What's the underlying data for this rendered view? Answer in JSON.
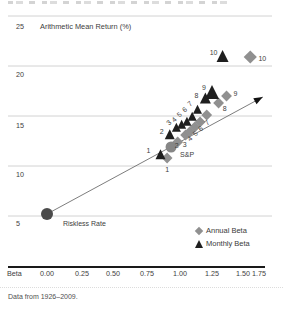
{
  "figure": {
    "title": "Arithmetic Mean Return (%)",
    "footnote": "Data from 1926–2009.",
    "x_axis_label": "Beta",
    "x_ticks": [
      "0.00",
      "0.25",
      "0.50",
      "0.75",
      "1.00",
      "1.25",
      "1.50",
      "1.75"
    ],
    "y_ticks": [
      "25",
      "20",
      "15",
      "10",
      "5"
    ]
  },
  "legend": {
    "annual_label": "Annual Beta",
    "monthly_label": "Monthly Beta"
  },
  "colors": {
    "monthly_triangle": "#1f1f1f",
    "annual_diamond": "#909090",
    "sp500_circle": "#868686",
    "riskless_circle": "#4b4b4b",
    "grid_line": "#d2d2d2",
    "sml_line": "#6e6e6e",
    "axis_bar": "#1a1a1a",
    "label_text": "#3d3d3d"
  },
  "chart_data": {
    "type": "scatter",
    "title": "Arithmetic Mean Return (%)",
    "xlabel": "Beta",
    "ylabel": "Arithmetic Mean Return (%)",
    "xlim": [
      -0.3,
      1.78
    ],
    "ylim": [
      2.5,
      25
    ],
    "x_tick_values": [
      0,
      0.25,
      0.5,
      0.75,
      1.0,
      1.25,
      1.5,
      1.75
    ],
    "y_tick_values": [
      25,
      20,
      15,
      10,
      5
    ],
    "grid": "horizontal",
    "legend_position": "bottom-right",
    "footnote": "Data from 1926–2009.",
    "series": [
      {
        "name": "Annual Beta",
        "marker": "diamond",
        "points": [
          {
            "label": "1",
            "beta": 0.91,
            "ret": 10.8,
            "lx": 0,
            "ly": 11
          },
          {
            "label": "2",
            "beta": 0.99,
            "ret": 12.4,
            "lx": -1,
            "ly": 3
          },
          {
            "label": "3",
            "beta": 1.05,
            "ret": 13.1,
            "lx": -1,
            "ly": 9
          },
          {
            "label": "4",
            "beta": 1.08,
            "ret": 13.4,
            "lx": 2,
            "ly": 6,
            "rot": -42
          },
          {
            "label": "5",
            "beta": 1.12,
            "ret": 13.9,
            "lx": 2,
            "ly": 6,
            "rot": -42
          },
          {
            "label": "6",
            "beta": 1.16,
            "ret": 14.4,
            "lx": 2,
            "ly": 6,
            "rot": -42
          },
          {
            "label": "7",
            "beta": 1.21,
            "ret": 15.1,
            "lx": 2,
            "ly": 7,
            "rot": -42
          },
          {
            "label": "8",
            "beta": 1.3,
            "ret": 16.3,
            "lx": 6,
            "ly": 5
          },
          {
            "label": "9",
            "beta": 1.36,
            "ret": 17.0,
            "lx": 9,
            "ly": -3
          },
          {
            "label": "10",
            "beta": 1.54,
            "ret": 20.9,
            "lx": 12,
            "ly": 1,
            "s": 11
          }
        ]
      },
      {
        "name": "Monthly Beta",
        "marker": "triangle",
        "points": [
          {
            "label": "1",
            "beta": 0.86,
            "ret": 11.1,
            "lx": -12,
            "ly": -5
          },
          {
            "label": "2",
            "beta": 0.93,
            "ret": 13.1,
            "lx": -8,
            "ly": -4
          },
          {
            "label": "3",
            "beta": 0.98,
            "ret": 13.8,
            "lx": -6,
            "ly": -6,
            "rot": -42,
            "s": 9
          },
          {
            "label": "4",
            "beta": 1.02,
            "ret": 14.1,
            "lx": -6,
            "ly": -6,
            "rot": -42,
            "s": 9
          },
          {
            "label": "5",
            "beta": 1.06,
            "ret": 14.4,
            "lx": -6,
            "ly": -8,
            "rot": -42,
            "s": 9
          },
          {
            "label": "6",
            "beta": 1.1,
            "ret": 14.9,
            "lx": -6,
            "ly": -8,
            "rot": -42,
            "s": 9
          },
          {
            "label": "7",
            "beta": 1.14,
            "ret": 15.6,
            "lx": -6,
            "ly": -7,
            "rot": -42,
            "s": 9
          },
          {
            "label": "8",
            "beta": 1.2,
            "ret": 16.7,
            "lx": -9,
            "ly": -4,
            "s": 11
          },
          {
            "label": "9",
            "beta": 1.25,
            "ret": 17.3,
            "lx": -8,
            "ly": -6,
            "s": 14
          },
          {
            "label": "10",
            "beta": 1.33,
            "ret": 20.9,
            "lx": -9,
            "ly": -5,
            "s": 12
          }
        ]
      },
      {
        "name": "S&P",
        "marker": "circle",
        "points": [
          {
            "label": "S&P",
            "beta": 0.94,
            "ret": 11.9,
            "r": 5.5,
            "lx": 9,
            "ly": 7,
            "anchor": "start"
          }
        ]
      },
      {
        "name": "Riskless Rate",
        "marker": "circle",
        "points": [
          {
            "label": "Riskless Rate",
            "beta": 0.0,
            "ret": 5.2,
            "r": 6,
            "lx": 16,
            "ly": 9,
            "anchor": "start"
          }
        ]
      }
    ],
    "security_market_line": {
      "x1_beta": 0.0,
      "y1_ret": 5.2,
      "x2_beta": 1.635,
      "y2_ret": 16.9,
      "arrow_at_end": true
    }
  }
}
